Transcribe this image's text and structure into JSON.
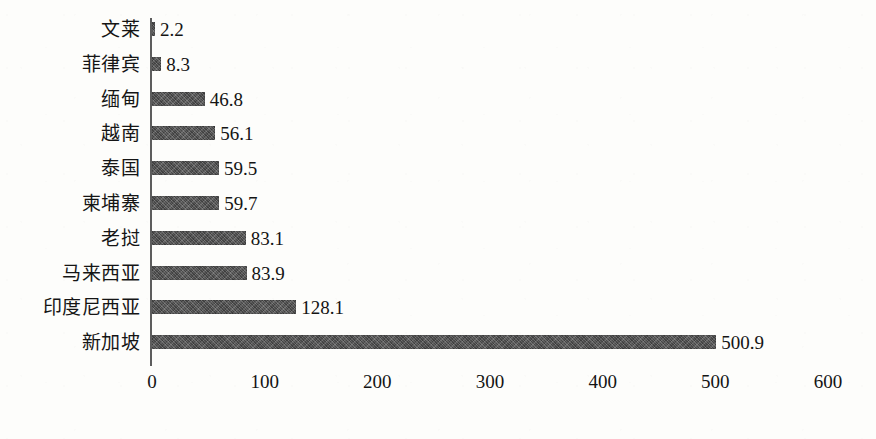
{
  "chart_data": {
    "type": "bar",
    "orientation": "horizontal",
    "title": "",
    "subtitle": "",
    "xlabel": "",
    "ylabel": "",
    "grid": false,
    "legend": null,
    "xlim": [
      0,
      600
    ],
    "x_ticks": [
      0,
      100,
      200,
      300,
      400,
      500,
      600
    ],
    "x_tick_labels": [
      "0",
      "100",
      "200",
      "300",
      "400",
      "500",
      "600"
    ],
    "categories": [
      "文莱",
      "菲律宾",
      "缅甸",
      "越南",
      "泰国",
      "柬埔寨",
      "老挝",
      "马来西亚",
      "印度尼西亚",
      "新加坡"
    ],
    "values": [
      2.2,
      8.3,
      46.8,
      56.1,
      59.5,
      59.7,
      83.1,
      83.9,
      128.1,
      500.9
    ],
    "value_labels": [
      "2.2",
      "8.3",
      "46.8",
      "56.1",
      "59.5",
      "59.7",
      "83.1",
      "83.9",
      "128.1",
      "500.9"
    ],
    "series": [
      {
        "name": "",
        "values": [
          2.2,
          8.3,
          46.8,
          56.1,
          59.5,
          59.7,
          83.1,
          83.9,
          128.1,
          500.9
        ]
      }
    ],
    "bar_color": "#4e4e4e",
    "background_color": "#fdfdfb",
    "axis_color": "#5d5d5d"
  }
}
